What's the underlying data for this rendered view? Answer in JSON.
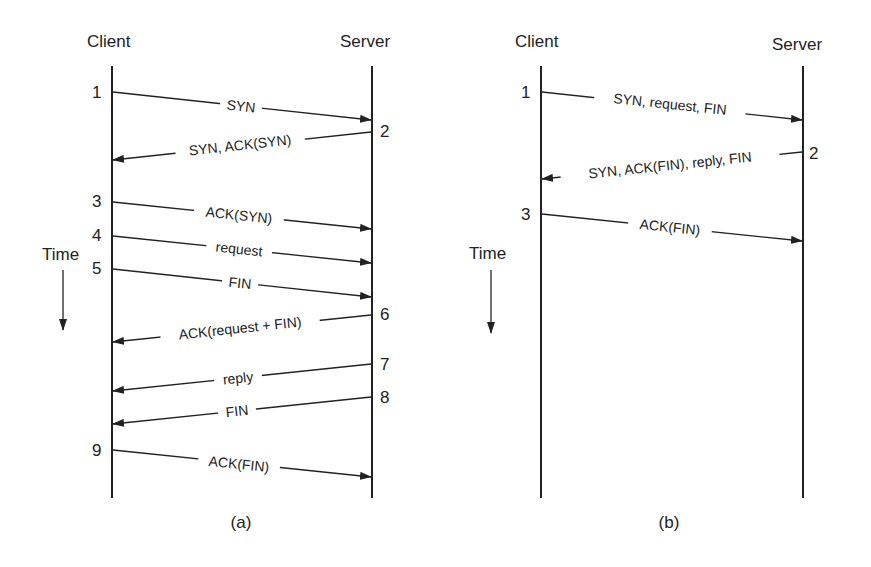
{
  "diagrams": [
    {
      "id": "a",
      "caption": "(a)",
      "client_label": "Client",
      "server_label": "Server",
      "time_label": "Time",
      "messages": [
        {
          "step": "1",
          "label": "SYN",
          "dir": "c2s"
        },
        {
          "step": "2",
          "label": "SYN, ACK(SYN)",
          "dir": "s2c"
        },
        {
          "step": "3",
          "label": "ACK(SYN)",
          "dir": "c2s"
        },
        {
          "step": "4",
          "label": "request",
          "dir": "c2s"
        },
        {
          "step": "5",
          "label": "FIN",
          "dir": "c2s"
        },
        {
          "step": "6",
          "label": "ACK(request + FIN)",
          "dir": "s2c"
        },
        {
          "step": "7",
          "label": "reply",
          "dir": "s2c"
        },
        {
          "step": "8",
          "label": "FIN",
          "dir": "s2c"
        },
        {
          "step": "9",
          "label": "ACK(FIN)",
          "dir": "c2s"
        }
      ]
    },
    {
      "id": "b",
      "caption": "(b)",
      "client_label": "Client",
      "server_label": "Server",
      "time_label": "Time",
      "messages": [
        {
          "step": "1",
          "label": "SYN, request, FIN",
          "dir": "c2s"
        },
        {
          "step": "2",
          "label": "SYN, ACK(FIN), reply, FIN",
          "dir": "s2c"
        },
        {
          "step": "3",
          "label": "ACK(FIN)",
          "dir": "c2s"
        }
      ]
    }
  ]
}
